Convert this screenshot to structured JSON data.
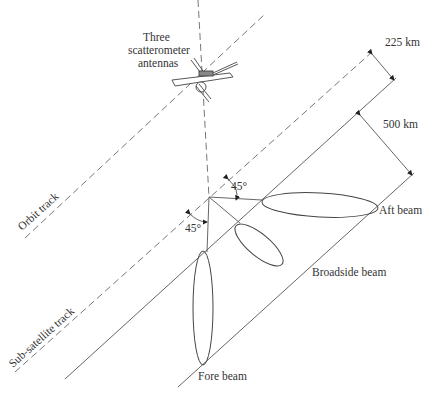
{
  "figure": {
    "type": "scatterometer-geometry-diagram",
    "labels": {
      "antennas_line1": "Three",
      "antennas_line2": "scatterometer",
      "antennas_line3": "antennas",
      "orbit_track": "Orbit track",
      "sub_satellite_track": "Sub-satellite track",
      "aft_beam": "Aft beam",
      "broadside_beam": "Broadside beam",
      "fore_beam": "Fore beam",
      "gap_distance": "225 km",
      "swath_width": "500 km",
      "angle_aft": "45°",
      "angle_fore": "45°"
    },
    "colors": {
      "line": "#555555",
      "text": "#333333",
      "background": "#ffffff"
    }
  }
}
